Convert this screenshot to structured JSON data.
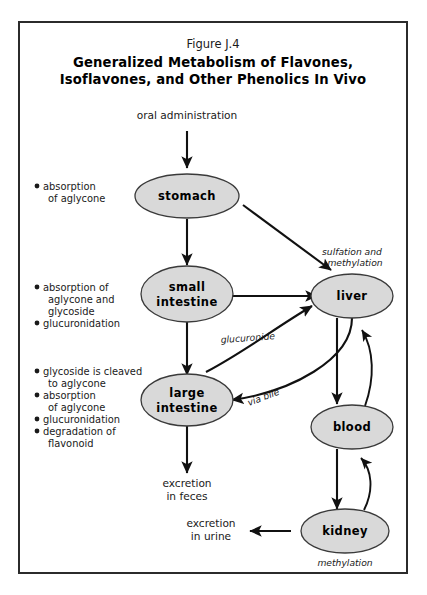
{
  "figure": {
    "number": "Figure J.4",
    "title_line1": "Generalized Metabolism of Flavones,",
    "title_line2": "Isoflavones, and Other Phenolics In Vivo"
  },
  "colors": {
    "node_fill": "#d9d9d9",
    "node_stroke": "#3a3a3a",
    "edge": "#111111",
    "frame": "#2b2b2b",
    "text": "#1a1a1a"
  },
  "entry": {
    "label": "oral administration"
  },
  "nodes": [
    {
      "id": "stomach",
      "label": "stomach"
    },
    {
      "id": "small-intestine",
      "label_line1": "small",
      "label_line2": "intestine"
    },
    {
      "id": "large-intestine",
      "label_line1": "large",
      "label_line2": "intestine"
    },
    {
      "id": "liver",
      "label": "liver"
    },
    {
      "id": "blood",
      "label": "blood"
    },
    {
      "id": "kidney",
      "label": "kidney"
    }
  ],
  "annotations": {
    "stomach_notes": [
      {
        "lines": [
          "absorption",
          "of aglycone"
        ]
      }
    ],
    "small_intestine_notes": [
      {
        "lines": [
          "absorption of",
          "aglycone and",
          "glycoside"
        ]
      },
      {
        "lines": [
          "glucuronidation"
        ]
      }
    ],
    "large_intestine_notes": [
      {
        "lines": [
          "glycoside is cleaved",
          "to aglycone"
        ]
      },
      {
        "lines": [
          "absorption",
          "of aglycone"
        ]
      },
      {
        "lines": [
          "glucuronidation"
        ]
      },
      {
        "lines": [
          "degradation of",
          "flavonoid"
        ]
      }
    ]
  },
  "edge_labels": {
    "glucuronide": "glucuronide",
    "via_bile": "via bile",
    "sulfation_line1": "sulfation and",
    "sulfation_line2": "methylation",
    "methylation": "methylation"
  },
  "outputs": {
    "feces_line1": "excretion",
    "feces_line2": "in feces",
    "urine_line1": "excretion",
    "urine_line2": "in urine"
  }
}
